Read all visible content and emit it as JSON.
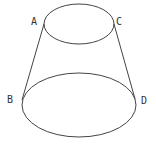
{
  "diagram": {
    "type": "frustum",
    "stroke_color": "#444444",
    "label_color": "#333333",
    "labels": {
      "A": "A",
      "B": "B",
      "C": "C",
      "D": "D"
    },
    "top_ellipse": {
      "cx": 79,
      "cy": 24,
      "rx": 35,
      "ry": 20
    },
    "bottom_ellipse": {
      "cx": 79,
      "cy": 105,
      "rx": 57,
      "ry": 32
    }
  }
}
